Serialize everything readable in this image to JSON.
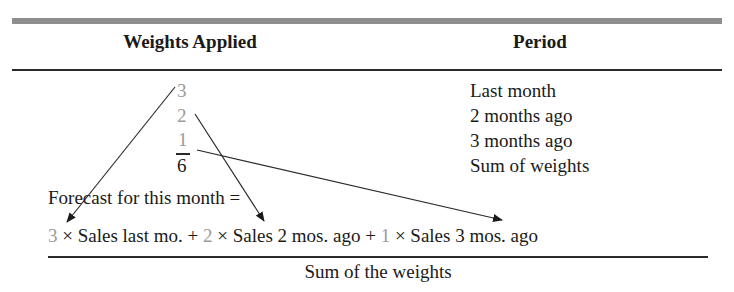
{
  "table": {
    "headers": {
      "weights": "Weights Applied",
      "period": "Period"
    },
    "rows": [
      {
        "weight": "3",
        "period": "Last month"
      },
      {
        "weight": "2",
        "period": "2 months ago"
      },
      {
        "weight": "1",
        "period": "3 months ago"
      },
      {
        "weight": "6",
        "period": "Sum of weights"
      }
    ]
  },
  "formula": {
    "label": "Forecast for this month =",
    "numerator": [
      {
        "weight": "3",
        "term": "× Sales last mo."
      },
      {
        "op": "+"
      },
      {
        "weight": "2",
        "term": "× Sales 2 mos. ago"
      },
      {
        "op": "+"
      },
      {
        "weight": "1",
        "term": "× Sales 3 mos. ago"
      }
    ],
    "denominator": "Sum of the weights"
  },
  "colors": {
    "weight_text": "#9a9a9a",
    "text": "#1a1a1a",
    "top_bar": "#8e8e8e"
  }
}
